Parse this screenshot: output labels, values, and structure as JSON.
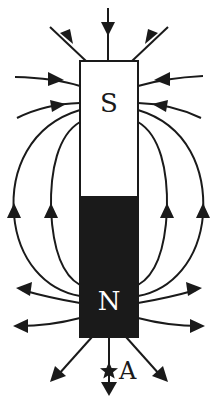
{
  "diagram": {
    "magnet": {
      "south_label": "S",
      "north_label": "N",
      "south_color": "#ffffff",
      "north_color": "#1a1a1a",
      "outline_color": "#1a1a1a"
    },
    "point_label": "A",
    "point_marker": "star",
    "field_direction": "out of N, into S"
  }
}
